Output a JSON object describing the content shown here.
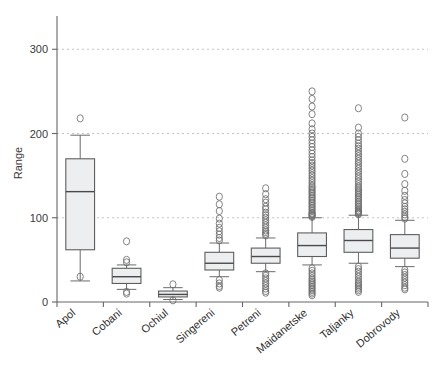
{
  "chart_data": {
    "type": "box",
    "title": "",
    "xlabel": "",
    "ylabel": "Range",
    "ylim": [
      0,
      330
    ],
    "yticks": [
      0,
      100,
      200,
      300
    ],
    "ytick_labels": [
      "0",
      "100",
      "200",
      "300"
    ],
    "grid": true,
    "grid_axis": "y",
    "legend": "none",
    "categories": [
      "Apol",
      "Cobani",
      "Ochiul",
      "Singereni",
      "Petreni",
      "Maidanetske",
      "Taljanky",
      "Dobrovody"
    ],
    "series": [
      {
        "name": "Apol",
        "whisker_low": 25,
        "q1": 62,
        "median": 131,
        "q3": 170,
        "whisker_high": 198,
        "outliers": [
          218,
          30
        ]
      },
      {
        "name": "Cobani",
        "whisker_low": 15,
        "q1": 22,
        "median": 30,
        "q3": 40,
        "whisker_high": 44,
        "outliers": [
          72,
          50,
          47,
          12,
          10
        ]
      },
      {
        "name": "Ochiul",
        "whisker_low": 3,
        "q1": 6,
        "median": 9,
        "q3": 13,
        "whisker_high": 17,
        "outliers": [
          21,
          2
        ]
      },
      {
        "name": "Singereni",
        "whisker_low": 30,
        "q1": 38,
        "median": 46,
        "q3": 59,
        "whisker_high": 70,
        "outliers": [
          125,
          116,
          108,
          99,
          93,
          88,
          84,
          80,
          76,
          73,
          26,
          22,
          19,
          17
        ]
      },
      {
        "name": "Petreni",
        "whisker_low": 36,
        "q1": 46,
        "median": 54,
        "q3": 64,
        "whisker_high": 76,
        "outliers": [
          135,
          128,
          122,
          118,
          113,
          110,
          106,
          103,
          100,
          97,
          94,
          91,
          88,
          85,
          83,
          81,
          79,
          34,
          31,
          28,
          25,
          22,
          19,
          16,
          13,
          11
        ]
      },
      {
        "name": "Maidanetske",
        "whisker_low": 44,
        "q1": 54,
        "median": 67,
        "q3": 82,
        "whisker_high": 100,
        "outliers": [
          250,
          241,
          232,
          223,
          212,
          205,
          200,
          196,
          192,
          188,
          184,
          180,
          176,
          172,
          168,
          165,
          162,
          159,
          156,
          153,
          150,
          147,
          144,
          141,
          138,
          136,
          134,
          132,
          130,
          128,
          126,
          124,
          122,
          120,
          118,
          116,
          114,
          112,
          110,
          108,
          106,
          105,
          104,
          103,
          102,
          101,
          40,
          37,
          34,
          31,
          28,
          26,
          24,
          22,
          20,
          18,
          16,
          14,
          12,
          10,
          8
        ],
        "dense": true
      },
      {
        "name": "Taljanky",
        "whisker_low": 46,
        "q1": 59,
        "median": 73,
        "q3": 86,
        "whisker_high": 103,
        "outliers": [
          230,
          207,
          200,
          196,
          192,
          188,
          185,
          182,
          179,
          176,
          173,
          170,
          167,
          164,
          161,
          158,
          155,
          152,
          149,
          146,
          143,
          140,
          137,
          135,
          133,
          131,
          129,
          127,
          125,
          123,
          121,
          119,
          117,
          115,
          113,
          111,
          109,
          108,
          107,
          106,
          105,
          104,
          42,
          39,
          36,
          33,
          30,
          27,
          24,
          22,
          20,
          18,
          16,
          14,
          12
        ],
        "dense": true
      },
      {
        "name": "Dobrovody",
        "whisker_low": 42,
        "q1": 52,
        "median": 64,
        "q3": 80,
        "whisker_high": 97,
        "outliers": [
          219,
          170,
          152,
          140,
          132,
          126,
          121,
          117,
          113,
          110,
          107,
          104,
          101,
          99,
          38,
          35,
          32,
          29,
          26,
          23,
          20,
          17,
          15
        ],
        "dense": true
      }
    ]
  },
  "colors": {
    "box_fill": "#eceef0",
    "box_stroke": "#5e5e5e",
    "median": "#4a4a4a",
    "whisker": "#6b6b6b",
    "outlier": "#6e6e6e",
    "axis": "#666666",
    "grid": "#bdbdbd",
    "text": "#3a3a3a",
    "background": "#ffffff"
  }
}
